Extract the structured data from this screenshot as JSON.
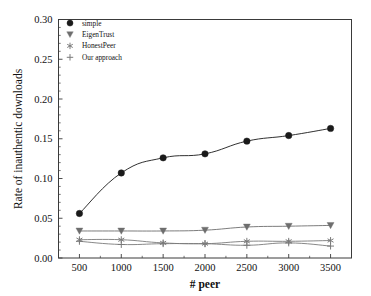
{
  "chart_data": {
    "type": "line",
    "title": "",
    "xlabel": "# peer",
    "ylabel": "Rate of inauthentic downloads",
    "x": [
      500,
      1000,
      1500,
      2000,
      2500,
      3000,
      3500
    ],
    "xticklabels": [
      "500",
      "1000",
      "1500",
      "2000",
      "2500",
      "3000",
      "3500"
    ],
    "yticklabels": [
      "0.00",
      "0.05",
      "0.10",
      "0.15",
      "0.20",
      "0.25",
      "0.30"
    ],
    "xlim": [
      250,
      3750
    ],
    "ylim": [
      0.0,
      0.3
    ],
    "grid": false,
    "legend_position": "top-left",
    "series": [
      {
        "name": "simple",
        "marker": "circle",
        "color": "#1a1a1a",
        "values": [
          0.056,
          0.107,
          0.126,
          0.131,
          0.147,
          0.154,
          0.163
        ]
      },
      {
        "name": "EigenTrust",
        "marker": "triangle-down",
        "color": "#6e6e6e",
        "values": [
          0.034,
          0.034,
          0.034,
          0.035,
          0.039,
          0.04,
          0.041
        ]
      },
      {
        "name": "HonestPeer",
        "marker": "asterisk",
        "color": "#7a7a7a",
        "values": [
          0.023,
          0.023,
          0.019,
          0.018,
          0.021,
          0.021,
          0.022
        ]
      },
      {
        "name": "Our approach",
        "marker": "plus",
        "color": "#7a7a7a",
        "values": [
          0.021,
          0.017,
          0.018,
          0.018,
          0.016,
          0.019,
          0.015
        ]
      }
    ]
  },
  "legend": {
    "items": [
      {
        "label": "simple"
      },
      {
        "label": "EigenTrust"
      },
      {
        "label": "HonestPeer"
      },
      {
        "label": "Our approach"
      }
    ]
  },
  "axes": {
    "x_title": "# peer",
    "y_title": "Rate of inauthentic downloads"
  }
}
